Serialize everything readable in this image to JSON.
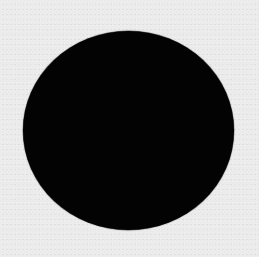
{
  "image": {
    "width": 259,
    "height": 257,
    "background_color": "#ebebeb",
    "shape": {
      "type": "ellipse",
      "fill_color": "#030303",
      "center_x": 128.5,
      "center_y": 130.5,
      "width": 211,
      "height": 199
    }
  }
}
